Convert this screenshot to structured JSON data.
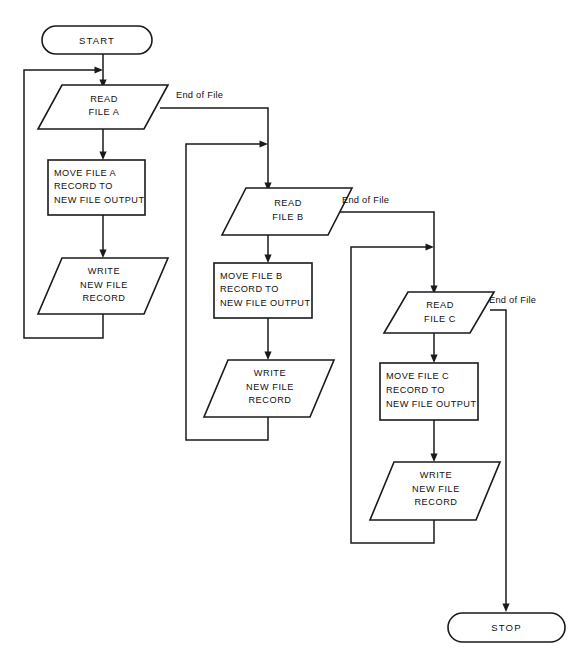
{
  "diagram": {
    "background_color": "#ffffff",
    "line_color": "#1a1a1a",
    "text_color": "#111111"
  },
  "terminals": {
    "start": "START",
    "stop": "STOP"
  },
  "edge_labels": {
    "eof_a": "End of File",
    "eof_b": "End of File",
    "eof_c": "End of File"
  },
  "branch_a": {
    "read": {
      "line1": "READ",
      "line2": "FILE  A"
    },
    "move": {
      "line1": "MOVE FILE A",
      "line2": "RECORD  TO",
      "line3": "NEW FILE OUTPUT"
    },
    "write": {
      "line1": "WRITE",
      "line2": "NEW  FILE",
      "line3": "RECORD"
    }
  },
  "branch_b": {
    "read": {
      "line1": "READ",
      "line2": "FILE  B"
    },
    "move": {
      "line1": "MOVE FILE B",
      "line2": "RECORD  TO",
      "line3": "NEW FILE OUTPUT"
    },
    "write": {
      "line1": "WRITE",
      "line2": "NEW  FILE",
      "line3": "RECORD"
    }
  },
  "branch_c": {
    "read": {
      "line1": "READ",
      "line2": "FILE  C"
    },
    "move": {
      "line1": "MOVE FILE C",
      "line2": "RECORD  TO",
      "line3": "NEW FILE OUTPUT"
    },
    "write": {
      "line1": "WRITE",
      "line2": "NEW  FILE",
      "line3": "RECORD"
    }
  }
}
